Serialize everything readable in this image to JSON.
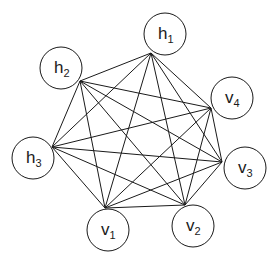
{
  "diagram": {
    "type": "complete-graph",
    "colors": {
      "stroke": "#1a1a1a",
      "background": "#ffffff",
      "node_fill": "#ffffff"
    },
    "node_radius": 21,
    "nodes": [
      {
        "id": "h1",
        "base": "h",
        "sub": "1",
        "cx": 165,
        "cy": 34,
        "ax": 151,
        "ay": 53
      },
      {
        "id": "h2",
        "base": "h",
        "sub": "2",
        "cx": 61,
        "cy": 68,
        "ax": 80,
        "ay": 81
      },
      {
        "id": "v4",
        "base": "v",
        "sub": "4",
        "cx": 232,
        "cy": 98,
        "ax": 211,
        "ay": 108
      },
      {
        "id": "h3",
        "base": "h",
        "sub": "3",
        "cx": 33,
        "cy": 158,
        "ax": 52,
        "ay": 147
      },
      {
        "id": "v3",
        "base": "v",
        "sub": "3",
        "cx": 245,
        "cy": 168,
        "ax": 222,
        "ay": 162
      },
      {
        "id": "v1",
        "base": "v",
        "sub": "1",
        "cx": 108,
        "cy": 230,
        "ax": 105,
        "ay": 208
      },
      {
        "id": "v2",
        "base": "v",
        "sub": "2",
        "cx": 193,
        "cy": 226,
        "ax": 185,
        "ay": 205
      }
    ],
    "edges": [
      [
        "h1",
        "h2"
      ],
      [
        "h1",
        "v4"
      ],
      [
        "h1",
        "h3"
      ],
      [
        "h1",
        "v3"
      ],
      [
        "h1",
        "v1"
      ],
      [
        "h1",
        "v2"
      ],
      [
        "h2",
        "v4"
      ],
      [
        "h2",
        "h3"
      ],
      [
        "h2",
        "v3"
      ],
      [
        "h2",
        "v1"
      ],
      [
        "h2",
        "v2"
      ],
      [
        "v4",
        "h3"
      ],
      [
        "v4",
        "v3"
      ],
      [
        "v4",
        "v1"
      ],
      [
        "v4",
        "v2"
      ],
      [
        "h3",
        "v3"
      ],
      [
        "h3",
        "v1"
      ],
      [
        "h3",
        "v2"
      ],
      [
        "v3",
        "v1"
      ],
      [
        "v3",
        "v2"
      ],
      [
        "v1",
        "v2"
      ]
    ]
  }
}
